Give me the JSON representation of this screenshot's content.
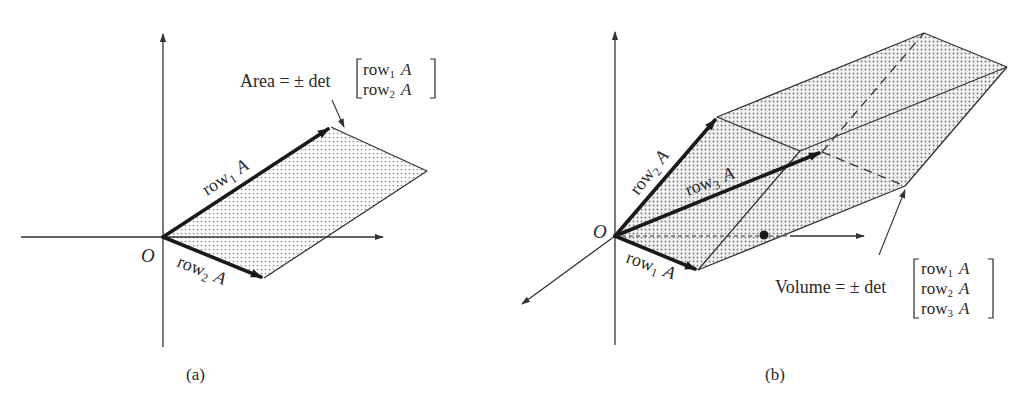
{
  "panels": [
    {
      "id": "a",
      "caption": "(a)",
      "origin_label": "O",
      "vectors": [
        {
          "name": "row",
          "sub": "1",
          "suffix": "A"
        },
        {
          "name": "row",
          "sub": "2",
          "suffix": "A"
        }
      ],
      "annotation": {
        "lhs": "Area = ± det",
        "matrix_rows": [
          {
            "name": "row",
            "sub": "1",
            "suffix": "A"
          },
          {
            "name": "row",
            "sub": "2",
            "suffix": "A"
          }
        ]
      }
    },
    {
      "id": "b",
      "caption": "(b)",
      "origin_label": "O",
      "vectors": [
        {
          "name": "row",
          "sub": "1",
          "suffix": "A"
        },
        {
          "name": "row",
          "sub": "2",
          "suffix": "A"
        },
        {
          "name": "row",
          "sub": "3",
          "suffix": "A"
        }
      ],
      "annotation": {
        "lhs": "Volume = ± det",
        "matrix_rows": [
          {
            "name": "row",
            "sub": "1",
            "suffix": "A"
          },
          {
            "name": "row",
            "sub": "2",
            "suffix": "A"
          },
          {
            "name": "row",
            "sub": "3",
            "suffix": "A"
          }
        ]
      }
    }
  ],
  "style": {
    "ink": "#2a2a2a",
    "fill_dot": "#8a8a8a",
    "background": "#ffffff"
  }
}
